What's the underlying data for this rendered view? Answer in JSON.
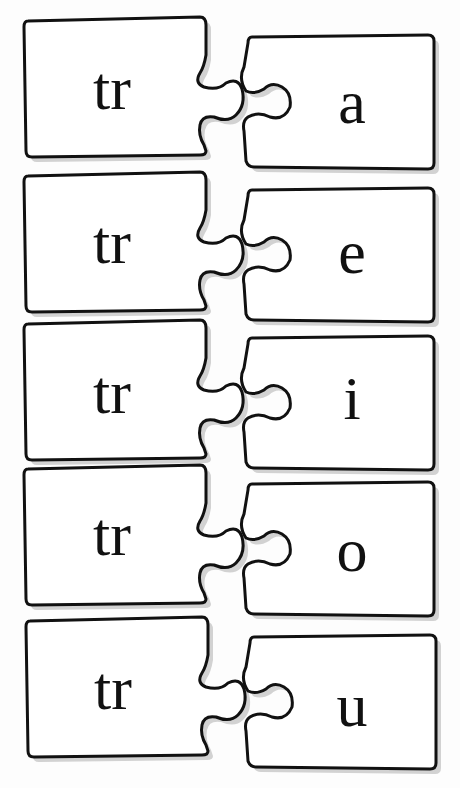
{
  "worksheet": {
    "title": "",
    "pairs": [
      {
        "left": "tr",
        "right": "a"
      },
      {
        "left": "tr",
        "right": "e"
      },
      {
        "left": "tr",
        "right": "i"
      },
      {
        "left": "tr",
        "right": "o"
      },
      {
        "left": "tr",
        "right": "u"
      }
    ]
  }
}
